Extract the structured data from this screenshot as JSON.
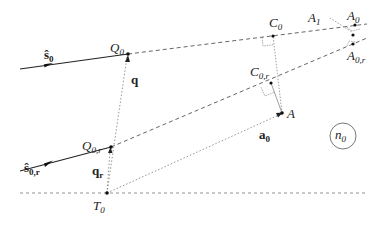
{
  "diagram": {
    "title": "",
    "colors": {
      "solid_line": "#222222",
      "dashed_line": "#555555",
      "dotted_line": "#888888",
      "point": "#111111"
    },
    "points": {
      "Q0": {
        "label": "Q",
        "sub": "0",
        "x": 128,
        "y": 54
      },
      "Q0r": {
        "label": "Q",
        "sub": "0,r",
        "x": 111,
        "y": 147
      },
      "T0": {
        "label": "T",
        "sub": "0",
        "x": 107,
        "y": 193
      },
      "C0": {
        "label": "C",
        "sub": "0",
        "x": 273,
        "y": 36
      },
      "C0r": {
        "label": "C",
        "sub": "0,r",
        "x": 271,
        "y": 83
      },
      "A": {
        "label": "A",
        "sub": "",
        "x": 282,
        "y": 113
      },
      "A0": {
        "label": "A",
        "sub": "0",
        "x": 355,
        "y": 25
      },
      "A1": {
        "label": "A",
        "sub": "1",
        "x": 320,
        "y": 18
      },
      "A0r": {
        "label": "A",
        "sub": "0,r",
        "x": 353,
        "y": 44
      }
    },
    "vectors": {
      "s0": {
        "label": "ŝ",
        "sub": "0"
      },
      "s0r": {
        "label": "ŝ",
        "sub": "0,r"
      },
      "q": {
        "label": "q",
        "sub": ""
      },
      "qr": {
        "label": "q",
        "sub": "r"
      },
      "a0": {
        "label": "a",
        "sub": "0"
      }
    },
    "medium": {
      "label": "n",
      "sub": "0"
    }
  }
}
